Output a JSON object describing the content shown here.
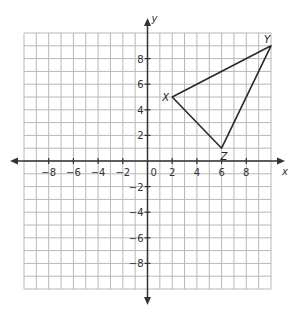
{
  "chart_data": {
    "type": "coordinate-plane",
    "title": "",
    "xlabel": "x",
    "ylabel": "y",
    "xlim": [
      -10,
      10
    ],
    "ylim": [
      -10,
      10
    ],
    "grid": true,
    "grid_step": 1,
    "x_tick_labels": [
      -8,
      -6,
      -4,
      -2,
      2,
      4,
      6,
      8
    ],
    "y_tick_labels": [
      8,
      6,
      4,
      2,
      -2,
      -4,
      -6,
      -8
    ],
    "origin_label": "0",
    "polygon": {
      "name": "triangle XYZ",
      "vertices": [
        {
          "label": "X",
          "x": 2,
          "y": 5
        },
        {
          "label": "Y",
          "x": 10,
          "y": 9
        },
        {
          "label": "Z",
          "x": 6,
          "y": 1
        }
      ]
    }
  },
  "colors": {
    "grid": "#b8b8b8",
    "axis": "#333333",
    "triangle": "#2a2a2a"
  }
}
